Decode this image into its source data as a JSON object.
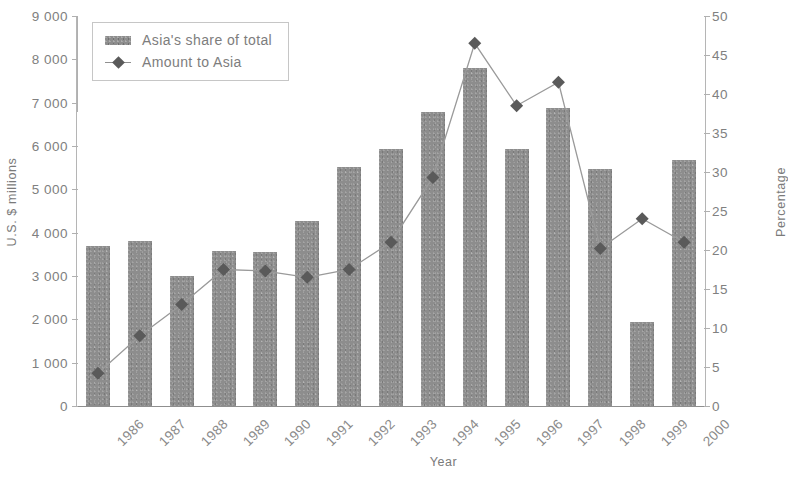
{
  "chart_data": {
    "type": "bar",
    "title": "",
    "xlabel": "Year",
    "ylabel": "U.S. $ millions",
    "ylabel_right": "Percentage",
    "grid": false,
    "legend_position": "top-left",
    "categories": [
      "1986",
      "1987",
      "1988",
      "1989",
      "1990",
      "1991",
      "1992",
      "1993",
      "1994",
      "1995",
      "1996",
      "1997",
      "1998",
      "1999",
      "2000"
    ],
    "ylim": [
      0,
      9000
    ],
    "yticks": [
      9000,
      8000,
      7000,
      6000,
      5000,
      4000,
      3000,
      2000,
      1000,
      0
    ],
    "ytick_labels": [
      "9 000",
      "8 000",
      "7 000",
      "6 000",
      "5 000",
      "4 000",
      "3 000",
      "2 000",
      "1 000",
      "0"
    ],
    "ylim_right": [
      0,
      50
    ],
    "yticks_right": [
      50,
      45,
      40,
      35,
      30,
      25,
      20,
      15,
      10,
      5,
      0
    ],
    "ytick_right_labels": [
      "50",
      "45",
      "40",
      "35",
      "30",
      "25",
      "20",
      "15",
      "10",
      "5",
      "0"
    ],
    "series": [
      {
        "name": "Asia's share of total",
        "type": "bar",
        "axis": "left",
        "color": "#8d8d8d",
        "values": [
          3700,
          3810,
          3000,
          3570,
          3560,
          4280,
          5520,
          5920,
          6790,
          7800,
          5930,
          6880,
          5480,
          1930,
          5680
        ]
      },
      {
        "name": "Amount to Asia",
        "type": "line",
        "axis": "right",
        "color": "#5a5a5a",
        "values": [
          4.2,
          9.0,
          13.0,
          17.5,
          17.3,
          16.5,
          17.5,
          21.0,
          29.3,
          46.5,
          38.5,
          41.5,
          20.2,
          24.0,
          21.0
        ]
      }
    ]
  },
  "legend": {
    "items": [
      {
        "label": "Asia's share of total",
        "marker": "bar-swatch"
      },
      {
        "label": "Amount to Asia",
        "marker": "diamond-line"
      }
    ]
  },
  "axes": {
    "left_title": "U.S. $ millions",
    "right_title": "Percentage",
    "bottom_title": "Year"
  }
}
